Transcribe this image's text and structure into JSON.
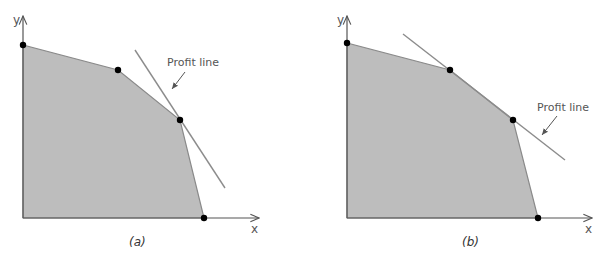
{
  "figure": {
    "colors": {
      "feasible_region": "#bdbdbd",
      "region_edge": "#8a8a8a",
      "axis": "#555555",
      "profit_line": "#8c8c8c",
      "vertex": "#000000",
      "text": "#555555"
    },
    "panels": [
      {
        "id": "a",
        "caption": "(a)",
        "axis_x_label": "x",
        "axis_y_label": "y",
        "profit_line_label": "Profit line",
        "description": "Profit line tangent to feasible region at a single corner point",
        "vertices": [
          [
            0,
            0
          ],
          [
            0,
            173
          ],
          [
            95,
            148
          ],
          [
            157,
            98
          ],
          [
            181,
            0
          ]
        ],
        "optimal_vertices": [
          [
            157,
            98
          ]
        ]
      },
      {
        "id": "b",
        "caption": "(b)",
        "axis_x_label": "x",
        "axis_y_label": "y",
        "profit_line_label": "Profit line",
        "description": "Profit line coincides with an edge of the feasible region (multiple optimal solutions)",
        "vertices": [
          [
            0,
            0
          ],
          [
            0,
            175
          ],
          [
            103,
            148
          ],
          [
            166,
            98
          ],
          [
            191,
            0
          ]
        ],
        "optimal_vertices": [
          [
            103,
            148
          ],
          [
            166,
            98
          ]
        ]
      }
    ]
  }
}
